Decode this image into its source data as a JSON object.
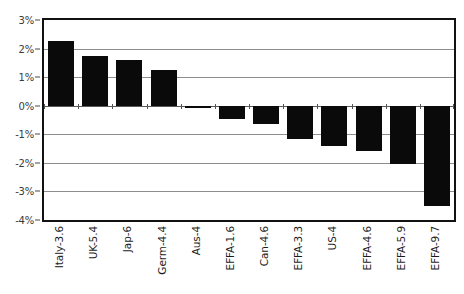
{
  "chart_data": {
    "type": "bar",
    "title": "",
    "xlabel": "",
    "ylabel": "",
    "ylim": [
      -4,
      3
    ],
    "yticks": [
      3,
      2,
      1,
      0,
      -1,
      -2,
      -3,
      -4
    ],
    "ytick_labels": [
      "3%",
      "2%",
      "1%",
      "0%",
      "-1%",
      "-2%",
      "-3%",
      "-4%"
    ],
    "grid": true,
    "legend": "none",
    "bar_color": "#0a0a0a",
    "categories": [
      "Italy-3.6",
      "UK-5.4",
      "Jap-6",
      "Germ-4.4",
      "Aus-4",
      "EFFA-1.6",
      "Can-4.6",
      "EFFA-3.3",
      "US-4",
      "EFFA-4.6",
      "EFFA-5.9",
      "EFFA-9.7"
    ],
    "values": [
      2.25,
      1.75,
      1.6,
      1.25,
      -0.07,
      -0.45,
      -0.65,
      -1.15,
      -1.4,
      -1.6,
      -2.05,
      -3.5
    ]
  },
  "axes": {
    "y_title": "",
    "x_title": ""
  }
}
